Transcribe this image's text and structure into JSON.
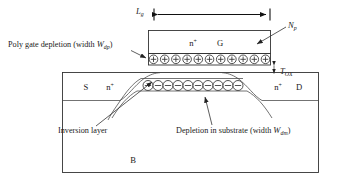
{
  "figure": {
    "background_color": "#ffffff",
    "line_color": "#222222"
  },
  "dimension": {
    "gate_length_label": "L",
    "gate_length_sub": "g"
  },
  "gate": {
    "doping_label": "n",
    "doping_sup": "+",
    "terminal_label": "G",
    "positive_charge_symbol": "+",
    "positive_charge_count": 11
  },
  "oxide": {
    "thickness_label": "T",
    "thickness_sub": "OX"
  },
  "substrate": {
    "source_label": "S",
    "source_doping_label": "n",
    "source_doping_sup": "+",
    "drain_label": "D",
    "drain_doping_label": "n",
    "drain_doping_sup": "+",
    "body_label": "B",
    "negative_charge_symbol": "−",
    "negative_charge_count": 10
  },
  "annotations": {
    "poly_gate_depletion": {
      "text_before": "Poly gate depletion (width ",
      "symbol": "W",
      "symbol_sub": "dp",
      "text_after": ")"
    },
    "poly_doping": {
      "symbol": "N",
      "symbol_sub": "p"
    },
    "inversion_layer": {
      "text": "Inversion layer"
    },
    "substrate_depletion": {
      "text_before": "Depletion in substrate (width ",
      "symbol": "W",
      "symbol_sub": "dm",
      "text_after": ")"
    }
  }
}
